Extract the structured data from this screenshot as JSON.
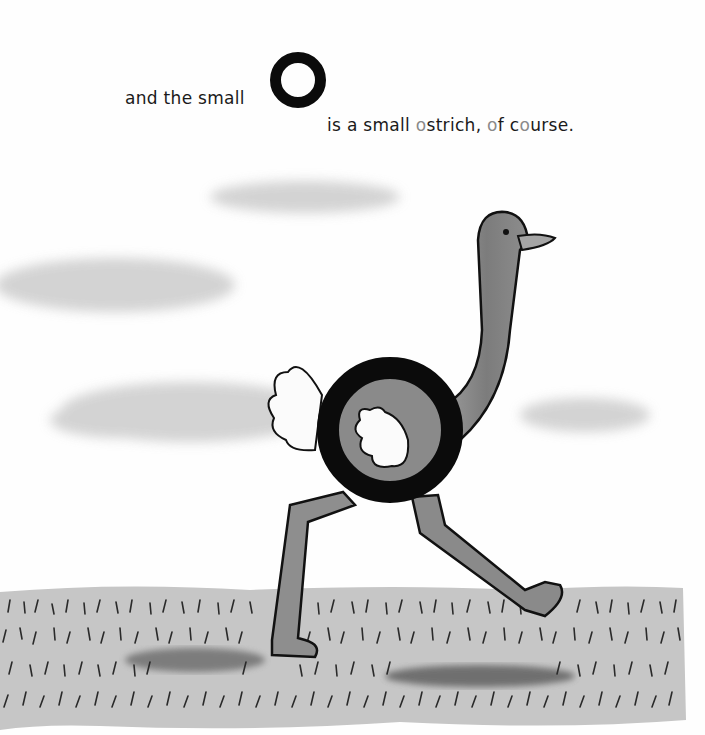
{
  "text": {
    "line1": "and the small",
    "big_letter": "O",
    "line2_parts": [
      "is a small ",
      "o",
      "strich, ",
      "o",
      "f c",
      "o",
      "urse."
    ]
  },
  "illustration": {
    "subject": "ostrich with O-shaped body walking on grass",
    "elements": [
      "clouds",
      "ostrich",
      "grass-field"
    ]
  },
  "colors": {
    "ink": "#0b0b0b",
    "ostrich_gray": "#8a8a8a",
    "grass_gray": "#c4c4c4",
    "cloud_gray": "#d8d8d8"
  }
}
